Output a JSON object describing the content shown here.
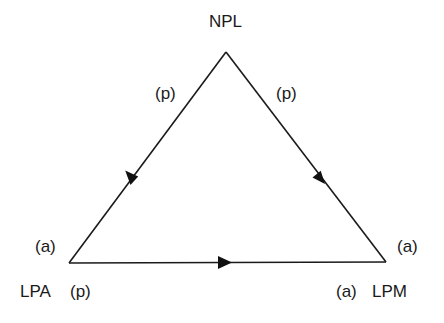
{
  "diagram": {
    "type": "triangle-flow",
    "line_color": "#1a1a1a",
    "nodes": {
      "top": {
        "id": "NPL",
        "label": "NPL",
        "x": 226,
        "y": 52
      },
      "left": {
        "id": "LPA",
        "label": "LPA",
        "x": 69,
        "y": 263
      },
      "right": {
        "id": "LPM",
        "label": "LPM",
        "x": 386,
        "y": 262
      }
    },
    "edges": [
      {
        "from": "NPL",
        "to": "LPA",
        "direction": "NPL→LPA"
      },
      {
        "from": "NPL",
        "to": "LPM",
        "direction": "NPL→LPM"
      },
      {
        "from": "LPA",
        "to": "LPM",
        "direction": "LPA→LPM"
      }
    ],
    "annotations": {
      "top_left_edge": "(p)",
      "top_right_edge": "(p)",
      "left_upper": "(a)",
      "left_lower": "(p)",
      "right_upper": "(a)",
      "right_lower": "(a)"
    }
  }
}
